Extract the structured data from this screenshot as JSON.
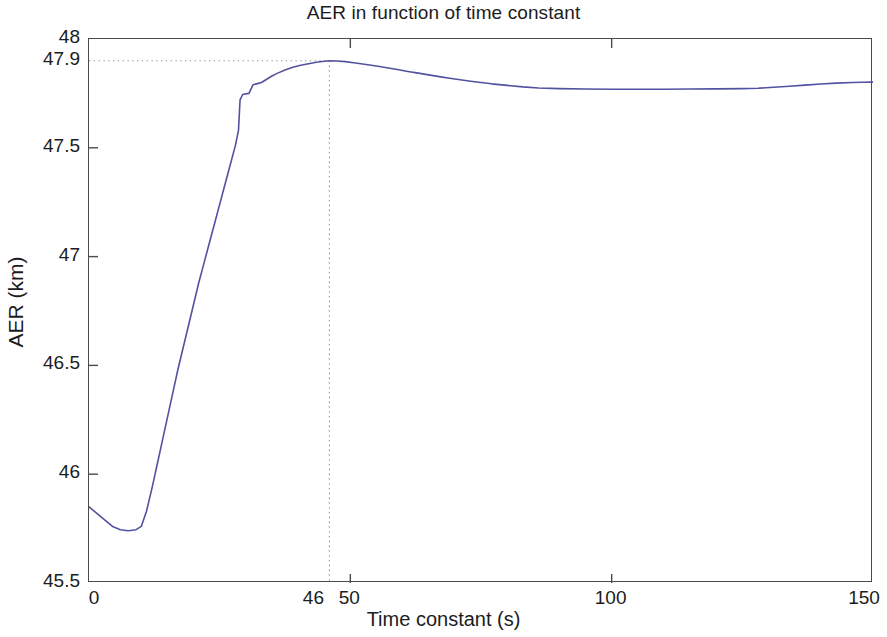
{
  "figure": {
    "background_color": "#ffffff",
    "frame_color": "#4b4b4b"
  },
  "chart_data": {
    "type": "line",
    "title": "AER in function of time constant",
    "xlabel": "Time constant (s)",
    "ylabel": "AER (km)",
    "xlim": [
      0,
      150
    ],
    "ylim": [
      45.5,
      48
    ],
    "xticks": [
      0,
      50,
      100,
      150
    ],
    "xtick_labels": [
      "0",
      "50",
      "100",
      "150"
    ],
    "yticks": [
      45.5,
      46,
      46.5,
      47,
      47.5,
      48
    ],
    "ytick_labels": [
      "45.5",
      "46",
      "46.5",
      "47",
      "47.5",
      "48"
    ],
    "grid": false,
    "legend": null,
    "line_color": "#5252a0",
    "line_width": 1.6,
    "annotations": {
      "cursor_x_label": "46",
      "cursor_y_label": "47.9",
      "cursor_x_value": 46,
      "cursor_y_value": 47.9,
      "marker_style": "dotted-crosshair",
      "marker_color": "#9a9a9a",
      "note": "Dotted crosshair marks the maximum of the curve at x=46 s, AER=47.9 km; the x label '46' overlaps the '50' axis tick label rendering as '4650'."
    },
    "series": [
      {
        "name": "AER",
        "x": [
          0,
          1.5,
          3,
          4.5,
          6,
          7.5,
          9,
          10,
          11,
          12,
          13,
          14,
          15,
          16,
          17,
          18,
          19,
          20,
          21,
          22,
          23,
          24,
          25,
          26,
          27,
          28,
          28.6,
          28.9,
          29.4,
          30,
          30.6,
          31.4,
          32.2,
          33,
          34,
          35,
          36,
          37.5,
          39,
          40.5,
          42,
          43.5,
          45,
          46,
          47.5,
          49,
          51,
          53,
          55,
          57,
          59,
          61,
          63,
          65,
          67,
          69,
          71,
          73,
          75,
          77,
          80,
          83,
          86,
          90,
          95,
          100,
          105,
          110,
          115,
          120,
          125,
          128,
          131,
          134,
          137,
          140,
          143,
          146,
          148,
          150
        ],
        "y": [
          45.85,
          45.82,
          45.79,
          45.76,
          45.745,
          45.74,
          45.745,
          45.76,
          45.83,
          45.93,
          46.04,
          46.15,
          46.26,
          46.37,
          46.48,
          46.58,
          46.68,
          46.78,
          46.88,
          46.97,
          47.06,
          47.15,
          47.24,
          47.33,
          47.42,
          47.51,
          47.58,
          47.72,
          47.745,
          47.748,
          47.75,
          47.79,
          47.795,
          47.8,
          47.815,
          47.83,
          47.842,
          47.858,
          47.87,
          47.879,
          47.886,
          47.893,
          47.898,
          47.9,
          47.899,
          47.896,
          47.89,
          47.883,
          47.876,
          47.868,
          47.86,
          47.851,
          47.843,
          47.835,
          47.827,
          47.82,
          47.813,
          47.806,
          47.8,
          47.794,
          47.787,
          47.78,
          47.775,
          47.772,
          47.77,
          47.769,
          47.769,
          47.769,
          47.77,
          47.771,
          47.772,
          47.774,
          47.778,
          47.783,
          47.788,
          47.793,
          47.797,
          47.8,
          47.801,
          47.802
        ]
      }
    ]
  }
}
